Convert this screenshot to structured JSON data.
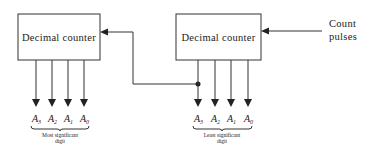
{
  "diagram": {
    "type": "block-diagram",
    "blocks": [
      {
        "id": "counter_msd",
        "label": "Decimal counter"
      },
      {
        "id": "counter_lsd",
        "label": "Decimal counter"
      }
    ],
    "input": {
      "label_line1": "Count",
      "label_line2": "pulses"
    },
    "msd_outputs": [
      {
        "letter": "A",
        "sub": "3"
      },
      {
        "letter": "A",
        "sub": "2"
      },
      {
        "letter": "A",
        "sub": "1"
      },
      {
        "letter": "A",
        "sub": "0"
      }
    ],
    "lsd_outputs": [
      {
        "letter": "A",
        "sub": "3"
      },
      {
        "letter": "A",
        "sub": "2"
      },
      {
        "letter": "A",
        "sub": "1"
      },
      {
        "letter": "A",
        "sub": "0"
      }
    ],
    "msd_caption": {
      "line1": "Most significant",
      "line2": "digit"
    },
    "lsd_caption": {
      "line1": "Least significant",
      "line2": "digit"
    },
    "connections": [
      {
        "from": "Count pulses",
        "to": "counter_lsd"
      },
      {
        "from": "counter_lsd.A3",
        "to": "counter_msd",
        "note": "carry/feedback"
      }
    ]
  }
}
